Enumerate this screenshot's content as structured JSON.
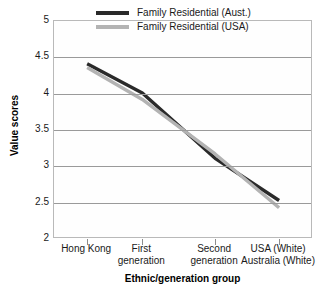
{
  "chart_data": {
    "type": "line",
    "title": "",
    "xlabel": "Ethnic/generation group",
    "ylabel": "Value scores",
    "categories": [
      "Hong Kong",
      "First\ngeneration",
      "Second\ngeneration",
      "USA (White)\nAustralia (White)"
    ],
    "series": [
      {
        "name": "Family Residential (Aust.)",
        "color": "#2a2a2a",
        "values": [
          4.41,
          4.01,
          3.11,
          2.53
        ]
      },
      {
        "name": "Family Residential (USA)",
        "color": "#b3b3b3",
        "values": [
          4.36,
          3.92,
          3.17,
          2.43
        ]
      }
    ],
    "ylim": [
      2,
      5
    ],
    "yticks": [
      "2",
      "2.5",
      "3",
      "3.5",
      "4",
      "4.5",
      "5"
    ],
    "ytick_values": [
      2,
      2.5,
      3,
      3.5,
      4,
      4.5,
      5
    ],
    "grid": true,
    "legend_position": "top-right-inside"
  },
  "axes": {
    "y_title": "Value scores",
    "x_title": "Ethnic/generation group"
  },
  "legend": {
    "entries": [
      {
        "label": "Family Residential (Aust.)",
        "color": "#2a2a2a"
      },
      {
        "label": "Family Residential (USA)",
        "color": "#b3b3b3"
      }
    ]
  },
  "colors": {
    "series_aust": "#2a2a2a",
    "series_usa": "#b3b3b3",
    "gridline": "#9a9a9a",
    "frame": "#b9b9b9",
    "background": "#ffffff"
  }
}
